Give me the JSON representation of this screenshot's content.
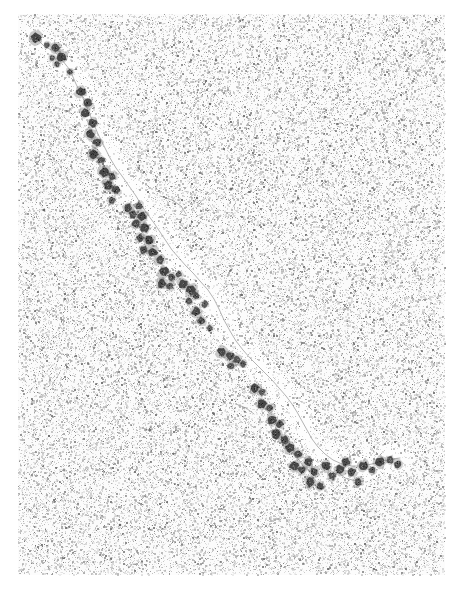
{
  "figure": {
    "domain_kind": "electron-micrograph",
    "technique": "transmission electron microscopy, negative stain / rotary shadow",
    "width_px": 469,
    "height_px": 590,
    "visible_labels": [],
    "scale_bar_present": false,
    "axis_present": false
  },
  "canvas": {
    "page_background": "#ffffff",
    "plate_background_base": "#fbfbfb",
    "plate_rect": {
      "x": 18,
      "y": 14,
      "w": 427,
      "h": 561
    },
    "vignette_strength": 0.1
  },
  "grain": {
    "description": "fine random monochrome speckle emulating photographic film grain of the micrograph plate",
    "density": 0.46,
    "dot_min_size_px": 1,
    "dot_max_size_px": 2,
    "color_dark": "#6b6b6b",
    "color_mid": "#a8a8a8",
    "color_light": "#d2d2d2",
    "seed": 20240517
  },
  "halo": {
    "description": "pale clearing of stain immediately around the filament, rendered as a light band along the fiber path",
    "color": "#fdfdfd",
    "radius_px": 15
  },
  "fiber": {
    "name": "chromatin-fiber",
    "stroke_color": "#9a9a9a",
    "stroke_width_px": 1.0,
    "description": "thin linker DNA filament threading through the nucleosome beads from upper-left to lower-right",
    "path_points": [
      [
        36,
        38
      ],
      [
        44,
        46
      ],
      [
        55,
        52
      ],
      [
        62,
        60
      ],
      [
        70,
        70
      ],
      [
        76,
        84
      ],
      [
        82,
        96
      ],
      [
        88,
        110
      ],
      [
        93,
        122
      ],
      [
        98,
        134
      ],
      [
        104,
        146
      ],
      [
        110,
        158
      ],
      [
        116,
        168
      ],
      [
        122,
        176
      ],
      [
        129,
        186
      ],
      [
        136,
        196
      ],
      [
        142,
        206
      ],
      [
        148,
        215
      ],
      [
        154,
        223
      ],
      [
        160,
        232
      ],
      [
        166,
        241
      ],
      [
        172,
        250
      ],
      [
        179,
        258
      ],
      [
        186,
        266
      ],
      [
        193,
        273
      ],
      [
        200,
        281
      ],
      [
        208,
        290
      ],
      [
        214,
        299
      ],
      [
        219,
        309
      ],
      [
        224,
        320
      ],
      [
        230,
        331
      ],
      [
        236,
        341
      ],
      [
        243,
        350
      ],
      [
        250,
        358
      ],
      [
        258,
        366
      ],
      [
        265,
        373
      ],
      [
        272,
        380
      ],
      [
        279,
        388
      ],
      [
        286,
        396
      ],
      [
        292,
        404
      ],
      [
        297,
        412
      ],
      [
        302,
        421
      ],
      [
        307,
        430
      ],
      [
        312,
        439
      ],
      [
        318,
        447
      ],
      [
        325,
        454
      ],
      [
        333,
        460
      ],
      [
        342,
        464
      ],
      [
        352,
        466
      ],
      [
        362,
        466
      ],
      [
        372,
        464
      ],
      [
        382,
        461
      ],
      [
        392,
        459
      ],
      [
        400,
        458
      ]
    ],
    "branch_paths": [
      [
        [
          160,
          196
        ],
        [
          172,
          200
        ],
        [
          181,
          206
        ],
        [
          186,
          214
        ]
      ],
      [
        [
          236,
          404
        ],
        [
          246,
          408
        ],
        [
          254,
          414
        ]
      ],
      [
        [
          292,
          452
        ],
        [
          300,
          461
        ],
        [
          305,
          470
        ]
      ],
      [
        [
          335,
          470
        ],
        [
          345,
          478
        ],
        [
          356,
          481
        ]
      ]
    ]
  },
  "nucleosomes": {
    "name": "nucleosome-beads",
    "count": 74,
    "core_color": "#3a3a3a",
    "rim_color": "#6e6e6e",
    "mean_diameter_px": 9,
    "note": "each bead drawn as a dark irregular blob with lighter mottled core, mimicking a stained nucleosome core particle",
    "beads": [
      {
        "x": 36,
        "y": 38,
        "r": 5.0,
        "dark": 0.88
      },
      {
        "x": 47,
        "y": 45,
        "r": 3.0,
        "dark": 0.55
      },
      {
        "x": 56,
        "y": 48,
        "r": 4.2,
        "dark": 0.78
      },
      {
        "x": 52,
        "y": 58,
        "r": 3.0,
        "dark": 0.6
      },
      {
        "x": 62,
        "y": 57,
        "r": 4.8,
        "dark": 0.9
      },
      {
        "x": 57,
        "y": 64,
        "r": 3.2,
        "dark": 0.62
      },
      {
        "x": 70,
        "y": 72,
        "r": 3.2,
        "dark": 0.55
      },
      {
        "x": 81,
        "y": 92,
        "r": 4.6,
        "dark": 0.86
      },
      {
        "x": 88,
        "y": 103,
        "r": 4.0,
        "dark": 0.72
      },
      {
        "x": 85,
        "y": 113,
        "r": 4.4,
        "dark": 0.84
      },
      {
        "x": 93,
        "y": 123,
        "r": 4.2,
        "dark": 0.8
      },
      {
        "x": 90,
        "y": 134,
        "r": 4.4,
        "dark": 0.86
      },
      {
        "x": 97,
        "y": 142,
        "r": 4.2,
        "dark": 0.76
      },
      {
        "x": 94,
        "y": 154,
        "r": 4.6,
        "dark": 0.88
      },
      {
        "x": 101,
        "y": 160,
        "r": 3.6,
        "dark": 0.68
      },
      {
        "x": 104,
        "y": 172,
        "r": 4.8,
        "dark": 0.9
      },
      {
        "x": 112,
        "y": 176,
        "r": 3.8,
        "dark": 0.7
      },
      {
        "x": 108,
        "y": 185,
        "r": 4.6,
        "dark": 0.86
      },
      {
        "x": 116,
        "y": 190,
        "r": 4.0,
        "dark": 0.74
      },
      {
        "x": 112,
        "y": 200,
        "r": 3.4,
        "dark": 0.6
      },
      {
        "x": 128,
        "y": 208,
        "r": 4.4,
        "dark": 0.82
      },
      {
        "x": 133,
        "y": 214,
        "r": 4.0,
        "dark": 0.74
      },
      {
        "x": 139,
        "y": 206,
        "r": 3.6,
        "dark": 0.64
      },
      {
        "x": 142,
        "y": 216,
        "r": 4.6,
        "dark": 0.86
      },
      {
        "x": 136,
        "y": 224,
        "r": 4.2,
        "dark": 0.78
      },
      {
        "x": 145,
        "y": 228,
        "r": 4.4,
        "dark": 0.84
      },
      {
        "x": 140,
        "y": 238,
        "r": 3.8,
        "dark": 0.7
      },
      {
        "x": 149,
        "y": 240,
        "r": 4.6,
        "dark": 0.88
      },
      {
        "x": 144,
        "y": 250,
        "r": 4.0,
        "dark": 0.74
      },
      {
        "x": 153,
        "y": 252,
        "r": 4.4,
        "dark": 0.84
      },
      {
        "x": 160,
        "y": 260,
        "r": 4.2,
        "dark": 0.78
      },
      {
        "x": 164,
        "y": 272,
        "r": 4.8,
        "dark": 0.9
      },
      {
        "x": 172,
        "y": 277,
        "r": 3.6,
        "dark": 0.62
      },
      {
        "x": 162,
        "y": 284,
        "r": 4.4,
        "dark": 0.84
      },
      {
        "x": 170,
        "y": 286,
        "r": 3.4,
        "dark": 0.6
      },
      {
        "x": 179,
        "y": 274,
        "r": 3.2,
        "dark": 0.55
      },
      {
        "x": 183,
        "y": 284,
        "r": 4.6,
        "dark": 0.86
      },
      {
        "x": 191,
        "y": 290,
        "r": 4.8,
        "dark": 0.9
      },
      {
        "x": 196,
        "y": 296,
        "r": 3.6,
        "dark": 0.66
      },
      {
        "x": 189,
        "y": 301,
        "r": 3.2,
        "dark": 0.58
      },
      {
        "x": 205,
        "y": 304,
        "r": 3.4,
        "dark": 0.6
      },
      {
        "x": 196,
        "y": 312,
        "r": 4.4,
        "dark": 0.82
      },
      {
        "x": 201,
        "y": 321,
        "r": 4.0,
        "dark": 0.72
      },
      {
        "x": 210,
        "y": 328,
        "r": 3.0,
        "dark": 0.52
      },
      {
        "x": 222,
        "y": 352,
        "r": 4.6,
        "dark": 0.86
      },
      {
        "x": 230,
        "y": 356,
        "r": 4.2,
        "dark": 0.78
      },
      {
        "x": 237,
        "y": 360,
        "r": 3.8,
        "dark": 0.68
      },
      {
        "x": 243,
        "y": 364,
        "r": 3.4,
        "dark": 0.6
      },
      {
        "x": 231,
        "y": 366,
        "r": 3.6,
        "dark": 0.64
      },
      {
        "x": 255,
        "y": 388,
        "r": 4.4,
        "dark": 0.84
      },
      {
        "x": 262,
        "y": 392,
        "r": 3.4,
        "dark": 0.6
      },
      {
        "x": 262,
        "y": 404,
        "r": 4.8,
        "dark": 0.9
      },
      {
        "x": 270,
        "y": 408,
        "r": 3.6,
        "dark": 0.64
      },
      {
        "x": 272,
        "y": 420,
        "r": 4.6,
        "dark": 0.86
      },
      {
        "x": 280,
        "y": 424,
        "r": 3.8,
        "dark": 0.7
      },
      {
        "x": 276,
        "y": 434,
        "r": 4.4,
        "dark": 0.82
      },
      {
        "x": 284,
        "y": 440,
        "r": 4.2,
        "dark": 0.76
      },
      {
        "x": 290,
        "y": 448,
        "r": 4.8,
        "dark": 0.9
      },
      {
        "x": 298,
        "y": 454,
        "r": 4.0,
        "dark": 0.74
      },
      {
        "x": 294,
        "y": 466,
        "r": 4.6,
        "dark": 0.88
      },
      {
        "x": 302,
        "y": 470,
        "r": 3.8,
        "dark": 0.7
      },
      {
        "x": 308,
        "y": 462,
        "r": 4.4,
        "dark": 0.82
      },
      {
        "x": 314,
        "y": 472,
        "r": 4.2,
        "dark": 0.78
      },
      {
        "x": 310,
        "y": 482,
        "r": 4.6,
        "dark": 0.86
      },
      {
        "x": 320,
        "y": 486,
        "r": 4.0,
        "dark": 0.74
      },
      {
        "x": 326,
        "y": 466,
        "r": 4.4,
        "dark": 0.84
      },
      {
        "x": 332,
        "y": 476,
        "r": 3.8,
        "dark": 0.68
      },
      {
        "x": 340,
        "y": 470,
        "r": 4.6,
        "dark": 0.88
      },
      {
        "x": 346,
        "y": 462,
        "r": 4.2,
        "dark": 0.78
      },
      {
        "x": 352,
        "y": 472,
        "r": 4.0,
        "dark": 0.72
      },
      {
        "x": 358,
        "y": 482,
        "r": 3.8,
        "dark": 0.68
      },
      {
        "x": 364,
        "y": 466,
        "r": 4.4,
        "dark": 0.84
      },
      {
        "x": 372,
        "y": 470,
        "r": 3.4,
        "dark": 0.58
      },
      {
        "x": 380,
        "y": 462,
        "r": 4.6,
        "dark": 0.88
      },
      {
        "x": 390,
        "y": 460,
        "r": 3.6,
        "dark": 0.64
      },
      {
        "x": 398,
        "y": 464,
        "r": 4.0,
        "dark": 0.72
      }
    ]
  },
  "debris": {
    "name": "stain-debris-specks",
    "description": "isolated dark specks of stain aggregate scattered over the support film",
    "color": "#555555",
    "specks": [
      {
        "x": 231,
        "y": 189,
        "r": 1.6
      },
      {
        "x": 197,
        "y": 198,
        "r": 1.2
      },
      {
        "x": 262,
        "y": 330,
        "r": 1.4
      },
      {
        "x": 92,
        "y": 328,
        "r": 1.3
      },
      {
        "x": 368,
        "y": 288,
        "r": 1.2
      },
      {
        "x": 150,
        "y": 430,
        "r": 1.5
      },
      {
        "x": 402,
        "y": 120,
        "r": 1.2
      },
      {
        "x": 64,
        "y": 470,
        "r": 1.4
      },
      {
        "x": 330,
        "y": 146,
        "r": 1.3
      },
      {
        "x": 258,
        "y": 520,
        "r": 1.2
      },
      {
        "x": 120,
        "y": 525,
        "r": 1.3
      },
      {
        "x": 412,
        "y": 372,
        "r": 1.2
      },
      {
        "x": 44,
        "y": 210,
        "r": 1.3
      },
      {
        "x": 352,
        "y": 210,
        "r": 1.1
      },
      {
        "x": 210,
        "y": 104,
        "r": 1.2
      },
      {
        "x": 440,
        "y": 4,
        "r": 1.6
      }
    ]
  }
}
